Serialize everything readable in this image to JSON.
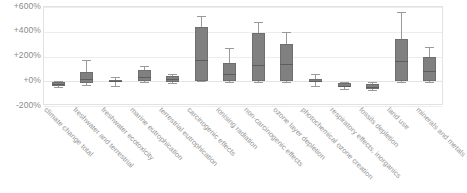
{
  "chart_data": {
    "type": "boxplot",
    "title": "",
    "subtitle": "",
    "xlabel": "",
    "ylabel": "",
    "ylim": [
      -200,
      600
    ],
    "grid": true,
    "legend": null,
    "y_ticks": [
      {
        "label": "+600%",
        "value": 600
      },
      {
        "label": "+400%",
        "value": 400
      },
      {
        "label": "+200%",
        "value": 200
      },
      {
        "label": "+0%",
        "value": 0
      },
      {
        "label": "-200%",
        "value": -200
      }
    ],
    "categories": [
      "climate change total",
      "freshwater and terrestrial",
      "freshwater ecotoxicity",
      "marine eutrophication",
      "terrestrial eutrophication",
      "carcinogenic effects",
      "ionising radiation",
      "non-carcinogenic effects",
      "ozone layer depletion",
      "photochemical ozone creation",
      "respiratory effects, inorganics",
      "fossils depletion",
      "land use",
      "minerals and metals"
    ],
    "boxes": [
      {
        "category": "climate change total",
        "min": -45,
        "q1": -40,
        "median": -25,
        "q3": -5,
        "max": 0
      },
      {
        "category": "freshwater and terrestrial",
        "min": -30,
        "q1": -15,
        "median": 20,
        "q3": 75,
        "max": 170
      },
      {
        "category": "freshwater ecotoxicity",
        "min": -35,
        "q1": -10,
        "median": 0,
        "q3": 10,
        "max": 35
      },
      {
        "category": "marine eutrophication",
        "min": -10,
        "q1": 5,
        "median": 35,
        "q3": 90,
        "max": 120
      },
      {
        "category": "terrestrial eutrophication",
        "min": -15,
        "q1": -5,
        "median": 15,
        "q3": 45,
        "max": 55
      },
      {
        "category": "carcinogenic effects",
        "min": 0,
        "q1": 5,
        "median": 170,
        "q3": 435,
        "max": 530
      },
      {
        "category": "ionising radiation",
        "min": -5,
        "q1": 0,
        "median": 55,
        "q3": 150,
        "max": 265
      },
      {
        "category": "non-carcinogenic effects",
        "min": -5,
        "q1": 0,
        "median": 130,
        "q3": 390,
        "max": 480
      },
      {
        "category": "ozone layer depletion",
        "min": -5,
        "q1": 0,
        "median": 140,
        "q3": 300,
        "max": 400
      },
      {
        "category": "photochemical ozone creation",
        "min": -35,
        "q1": -10,
        "median": 5,
        "q3": 20,
        "max": 55
      },
      {
        "category": "respiratory effects, inorganics",
        "min": -60,
        "q1": -50,
        "median": -35,
        "q3": -15,
        "max": -5
      },
      {
        "category": "fossils depletion",
        "min": -70,
        "q1": -60,
        "median": -45,
        "q3": -20,
        "max": -10
      },
      {
        "category": "land use",
        "min": -5,
        "q1": 0,
        "median": 160,
        "q3": 340,
        "max": 560
      },
      {
        "category": "minerals and metals",
        "min": -5,
        "q1": 0,
        "median": 85,
        "q3": 195,
        "max": 275
      }
    ],
    "colors": {
      "box_fill": "#808080",
      "box_stroke": "#6f6f6f",
      "median": "#5d5d5d",
      "whisker": "#9a9a9a",
      "gridline": "#ededed",
      "frame": "#e2e2e2",
      "tick_text": "#8c8c8c",
      "category_text": "#969696",
      "background": "#ffffff"
    }
  }
}
